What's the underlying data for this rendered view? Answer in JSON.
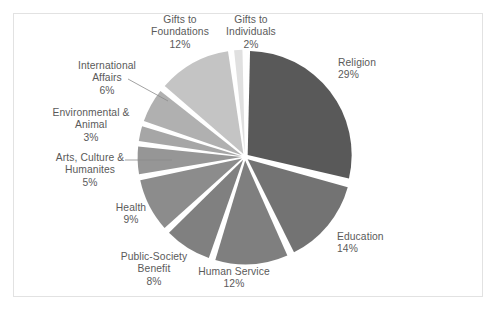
{
  "chart_data": {
    "type": "pie",
    "title": "",
    "exploded": true,
    "start_angle_deg": 0,
    "direction": "clockwise",
    "gap_deg": 2.6,
    "categories": [
      "Religion",
      "Education",
      "Human Service",
      "Public-Society Benefit",
      "Health",
      "Arts, Culture & Humanites",
      "Environmental & Animal",
      "International Affairs",
      "Gifts to Foundations",
      "Gifts to Individuals"
    ],
    "values": [
      29,
      14,
      12,
      8,
      9,
      5,
      3,
      6,
      12,
      2
    ],
    "value_labels": [
      "29%",
      "14%",
      "12%",
      "8%",
      "9%",
      "5%",
      "3%",
      "6%",
      "12%",
      "2%"
    ],
    "colors": [
      "#595959",
      "#737373",
      "#7f7f7f",
      "#808080",
      "#8c8c8c",
      "#969696",
      "#a6a6a6",
      "#b0b0b0",
      "#c4c4c4",
      "#e0e0e0"
    ],
    "slices": [
      {
        "label": "Religion",
        "value": 29,
        "value_label": "29%",
        "color": "#595959"
      },
      {
        "label": "Education",
        "value": 14,
        "value_label": "14%",
        "color": "#737373"
      },
      {
        "label": "Human Service",
        "value": 12,
        "value_label": "12%",
        "color": "#7f7f7f"
      },
      {
        "label": "Public-Society Benefit",
        "value": 8,
        "value_label": "8%",
        "color": "#808080"
      },
      {
        "label": "Health",
        "value": 9,
        "value_label": "9%",
        "color": "#8c8c8c"
      },
      {
        "label": "Arts, Culture & Humanites",
        "value": 5,
        "value_label": "5%",
        "color": "#969696"
      },
      {
        "label": "Environmental & Animal",
        "value": 3,
        "value_label": "3%",
        "color": "#a6a6a6"
      },
      {
        "label": "International Affairs",
        "value": 6,
        "value_label": "6%",
        "color": "#b0b0b0"
      },
      {
        "label": "Gifts to Foundations",
        "value": 12,
        "value_label": "12%",
        "color": "#c4c4c4"
      },
      {
        "label": "Gifts to Individuals",
        "value": 2,
        "value_label": "2%",
        "color": "#e0e0e0"
      }
    ],
    "legend": "none",
    "grid": false,
    "xlabel": "",
    "ylabel": ""
  },
  "labels": {
    "religion": "Religion\n29%",
    "education": "Education\n14%",
    "human_service": "Human Service\n12%",
    "public_society": "Public-Society\nBenefit\n8%",
    "health": "Health\n9%",
    "arts": "Arts, Culture &\nHumanites\n5%",
    "environmental": "Environmental &\nAnimal\n3%",
    "international": "International\nAffairs\n6%",
    "foundations": "Gifts to\nFoundations\n12%",
    "individuals": "Gifts to\nIndividuals\n2%"
  },
  "style": {
    "background": "#ffffff",
    "frame_border": "#e2e2e2",
    "text_color": "#5a5a5a",
    "leader_line": "#8a8a8a"
  }
}
